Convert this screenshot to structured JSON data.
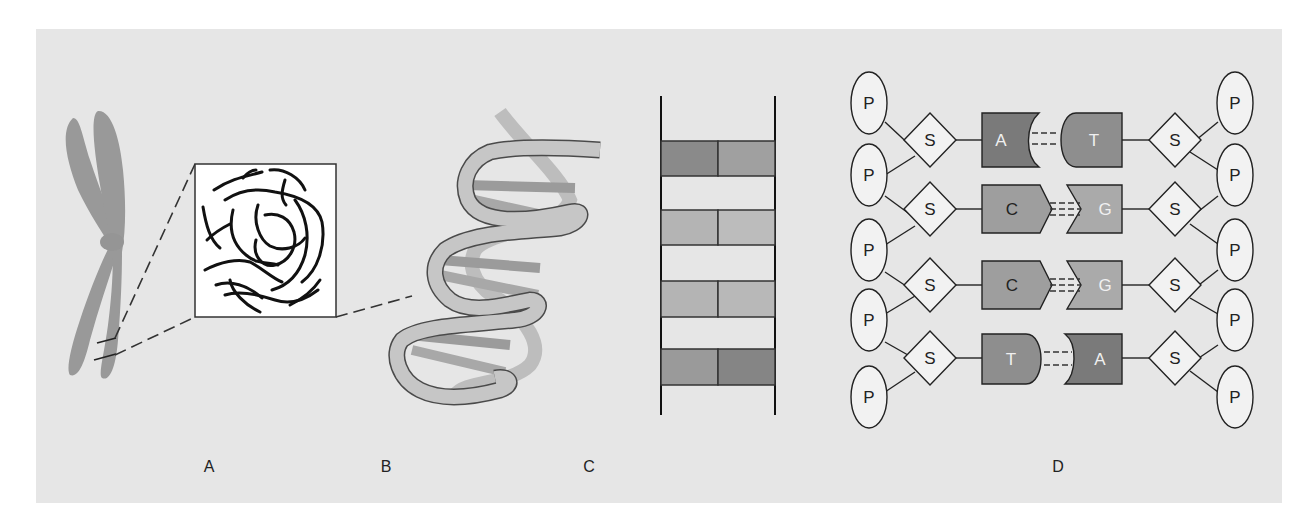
{
  "figure": {
    "background": "#e6e6e6",
    "panels": [
      {
        "id": "A",
        "label": "A",
        "description": "Chromosome with magnified box of coiled DNA fiber"
      },
      {
        "id": "B",
        "label": "B",
        "description": "DNA double helix"
      },
      {
        "id": "C",
        "label": "C",
        "description": "Ladder representation of base pairs"
      },
      {
        "id": "D",
        "label": "D",
        "description": "Nucleotide structure: phosphate, sugar, bases"
      }
    ]
  },
  "panel_c": {
    "rungs": [
      {
        "left_color": "#8a8a8a",
        "right_color": "#a0a0a0"
      },
      {
        "left_color": "#b4b4b4",
        "right_color": "#bcbcbc"
      },
      {
        "left_color": "#b4b4b4",
        "right_color": "#b8b8b8"
      },
      {
        "left_color": "#9a9a9a",
        "right_color": "#858585"
      }
    ]
  },
  "panel_d": {
    "phosphate_label": "P",
    "sugar_label": "S",
    "pairs": [
      {
        "left": "A",
        "right": "T",
        "bonds": 2
      },
      {
        "left": "C",
        "right": "G",
        "bonds": 3
      },
      {
        "left": "C",
        "right": "G",
        "bonds": 3
      },
      {
        "left": "T",
        "right": "A",
        "bonds": 2
      }
    ],
    "colors": {
      "A": "#7a7a7a",
      "T": "#8e8e8e",
      "C": "#9e9e9e",
      "G": "#aaaaaa"
    }
  }
}
